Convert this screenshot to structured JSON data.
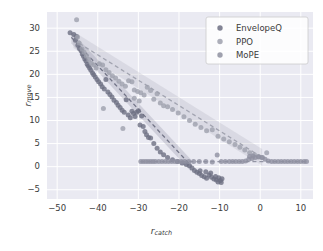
{
  "chart_data": {
    "type": "scatter",
    "title": "",
    "xlabel": "r_catch",
    "ylabel": "r_move",
    "xlabel_parts": {
      "base": "r",
      "sub": "catch"
    },
    "ylabel_parts": {
      "base": "r",
      "sub": "move"
    },
    "xlim": [
      -52.5,
      13.0
    ],
    "ylim": [
      -7.0,
      33.5
    ],
    "xticks": [
      -50,
      -40,
      -30,
      -20,
      -10,
      0,
      10
    ],
    "yticks": [
      -5,
      0,
      5,
      10,
      15,
      20,
      25,
      30
    ],
    "grid": true,
    "grid_color": "#ffffff",
    "plot_bg": "#eaeaf2",
    "figure_bg": "#ffffff",
    "legend": {
      "position": "upper right",
      "entries": [
        {
          "label": "EnvelopeQ",
          "color": "#6d6f82"
        },
        {
          "label": "PPO",
          "color": "#9ea0ad"
        },
        {
          "label": "MoPE",
          "color": "#8e90a0"
        }
      ]
    },
    "series": [
      {
        "name": "EnvelopeQ",
        "color": "#6d6f82",
        "marker": "o",
        "trend": {
          "type": "line",
          "style": "dashed",
          "x": [
            -46.5,
            -17.0
          ],
          "y": [
            28.0,
            0.2
          ],
          "band": 1.3
        },
        "points": [
          [
            -46.8,
            29.0
          ],
          [
            -45.9,
            28.6
          ],
          [
            -45.5,
            27.4
          ],
          [
            -45.2,
            28.2
          ],
          [
            -44.9,
            26.3
          ],
          [
            -44.5,
            25.6
          ],
          [
            -44.1,
            25.1
          ],
          [
            -43.8,
            24.4
          ],
          [
            -43.5,
            23.9
          ],
          [
            -43.2,
            23.3
          ],
          [
            -42.9,
            22.9
          ],
          [
            -42.6,
            22.2
          ],
          [
            -42.3,
            21.8
          ],
          [
            -42.0,
            21.4
          ],
          [
            -41.7,
            20.9
          ],
          [
            -41.3,
            20.3
          ],
          [
            -41.0,
            19.9
          ],
          [
            -40.6,
            19.4
          ],
          [
            -40.2,
            18.9
          ],
          [
            -39.8,
            18.4
          ],
          [
            -39.3,
            17.9
          ],
          [
            -38.9,
            17.3
          ],
          [
            -38.4,
            16.8
          ],
          [
            -38.0,
            18.9
          ],
          [
            -37.5,
            16.2
          ],
          [
            -37.0,
            15.6
          ],
          [
            -36.5,
            15.1
          ],
          [
            -36.0,
            14.4
          ],
          [
            -35.4,
            13.9
          ],
          [
            -35.0,
            13.3
          ],
          [
            -34.5,
            12.8
          ],
          [
            -34.0,
            12.2
          ],
          [
            -33.5,
            11.8
          ],
          [
            -33.0,
            14.5
          ],
          [
            -32.5,
            11.2
          ],
          [
            -32.0,
            10.6
          ],
          [
            -31.6,
            12.0
          ],
          [
            -31.2,
            11.5
          ],
          [
            -30.8,
            10.9
          ],
          [
            -30.4,
            11.8
          ],
          [
            -30.0,
            12.1
          ],
          [
            -29.6,
            9.0
          ],
          [
            -29.2,
            11.0
          ],
          [
            -28.8,
            8.7
          ],
          [
            -28.4,
            7.6
          ],
          [
            -28.0,
            6.9
          ],
          [
            -27.5,
            6.3
          ],
          [
            -27.0,
            6.2
          ],
          [
            -26.2,
            5.0
          ],
          [
            -25.4,
            4.0
          ],
          [
            -24.6,
            3.2
          ],
          [
            -23.8,
            2.6
          ],
          [
            -22.8,
            2.0
          ],
          [
            -21.6,
            1.5
          ],
          [
            -20.4,
            1.1
          ],
          [
            -19.2,
            0.8
          ],
          [
            -18.2,
            0.5
          ],
          [
            -17.4,
            0.2
          ],
          [
            -16.8,
            -0.3
          ],
          [
            -16.2,
            -0.8
          ],
          [
            -15.6,
            -1.2
          ],
          [
            -15.0,
            -1.5
          ],
          [
            -14.4,
            -1.9
          ],
          [
            -13.8,
            -2.2
          ],
          [
            -13.2,
            -2.5
          ],
          [
            -12.6,
            -1.8
          ],
          [
            -12.0,
            -2.3
          ],
          [
            -11.4,
            -2.7
          ],
          [
            -10.8,
            -2.9
          ],
          [
            -10.2,
            -2.4
          ],
          [
            -9.8,
            -3.0
          ],
          [
            -9.4,
            -2.6
          ],
          [
            -14.8,
            -0.9
          ],
          [
            -13.4,
            -1.1
          ],
          [
            -12.2,
            -1.4
          ],
          [
            -11.0,
            -2.1
          ],
          [
            -10.4,
            -3.3
          ],
          [
            -9.6,
            -3.4
          ]
        ]
      },
      {
        "name": "PPO",
        "color": "#9ea0ad",
        "marker": "o",
        "trend": {
          "type": "line",
          "style": "dashed",
          "x": [
            -46.0,
            0.5
          ],
          "y": [
            27.5,
            2.0
          ],
          "band": 1.8
        },
        "points": [
          [
            -45.2,
            31.8
          ],
          [
            -45.0,
            28.1
          ],
          [
            -44.6,
            26.8
          ],
          [
            -43.9,
            25.5
          ],
          [
            -43.4,
            24.8
          ],
          [
            -42.8,
            24.0
          ],
          [
            -42.2,
            23.2
          ],
          [
            -41.6,
            22.4
          ],
          [
            -41.0,
            22.0
          ],
          [
            -40.4,
            21.4
          ],
          [
            -39.6,
            22.3
          ],
          [
            -38.8,
            22.0
          ],
          [
            -38.0,
            21.0
          ],
          [
            -37.2,
            20.4
          ],
          [
            -36.4,
            19.7
          ],
          [
            -35.6,
            19.2
          ],
          [
            -34.8,
            18.5
          ],
          [
            -34.0,
            17.9
          ],
          [
            -33.2,
            17.4
          ],
          [
            -32.4,
            18.6
          ],
          [
            -31.6,
            18.4
          ],
          [
            -31.0,
            16.6
          ],
          [
            -30.2,
            16.3
          ],
          [
            -29.4,
            16.0
          ],
          [
            -28.6,
            15.5
          ],
          [
            -27.8,
            17.2
          ],
          [
            -27.0,
            16.5
          ],
          [
            -26.2,
            14.6
          ],
          [
            -25.4,
            15.8
          ],
          [
            -24.6,
            13.8
          ],
          [
            -23.8,
            13.2
          ],
          [
            -22.8,
            13.0
          ],
          [
            -21.6,
            12.4
          ],
          [
            -20.2,
            11.6
          ],
          [
            -18.8,
            10.8
          ],
          [
            -17.4,
            10.0
          ],
          [
            -16.0,
            9.2
          ],
          [
            -14.6,
            8.5
          ],
          [
            -13.2,
            7.8
          ],
          [
            -11.8,
            8.0
          ],
          [
            -10.4,
            6.6
          ],
          [
            -9.0,
            6.0
          ],
          [
            -7.6,
            5.4
          ],
          [
            -6.2,
            4.8
          ],
          [
            -5.0,
            4.2
          ],
          [
            -3.8,
            3.6
          ],
          [
            -2.6,
            3.0
          ],
          [
            -1.4,
            2.6
          ],
          [
            -0.4,
            2.2
          ],
          [
            0.6,
            2.0
          ],
          [
            1.6,
            3.0
          ],
          [
            -38.6,
            12.6
          ],
          [
            -33.8,
            8.3
          ],
          [
            -31.0,
            14.8
          ],
          [
            -29.8,
            14.2
          ]
        ]
      },
      {
        "name": "MoPE",
        "color": "#8e90a0",
        "marker": "o",
        "trend": {
          "type": "line",
          "style": "dashed",
          "x": [
            -29.5,
            11.5
          ],
          "y": [
            1.1,
            1.1
          ],
          "band": 0.0
        },
        "points": [
          [
            -29.4,
            1.1
          ],
          [
            -28.8,
            1.1
          ],
          [
            -28.2,
            1.1
          ],
          [
            -27.6,
            1.1
          ],
          [
            -27.0,
            1.1
          ],
          [
            -26.4,
            1.1
          ],
          [
            -25.8,
            1.1
          ],
          [
            -25.0,
            1.1
          ],
          [
            -24.2,
            1.1
          ],
          [
            -23.4,
            1.1
          ],
          [
            -22.6,
            1.1
          ],
          [
            -21.8,
            1.1
          ],
          [
            -21.0,
            1.1
          ],
          [
            -20.2,
            1.1
          ],
          [
            -19.4,
            1.1
          ],
          [
            -18.6,
            1.1
          ],
          [
            -17.6,
            1.1
          ],
          [
            -16.4,
            1.1
          ],
          [
            -15.0,
            1.1
          ],
          [
            -13.4,
            1.1
          ],
          [
            -11.8,
            1.0
          ],
          [
            -10.6,
            2.5
          ],
          [
            -9.6,
            1.1
          ],
          [
            -8.6,
            1.1
          ],
          [
            -7.6,
            1.1
          ],
          [
            -6.8,
            1.1
          ],
          [
            -6.0,
            1.1
          ],
          [
            -5.2,
            1.1
          ],
          [
            -4.4,
            1.1
          ],
          [
            -3.6,
            1.2
          ],
          [
            -2.8,
            1.6
          ],
          [
            -2.0,
            1.8
          ],
          [
            -1.2,
            2.0
          ],
          [
            -0.4,
            2.1
          ],
          [
            0.4,
            2.0
          ],
          [
            1.2,
            1.6
          ],
          [
            2.0,
            1.2
          ],
          [
            2.8,
            1.1
          ],
          [
            3.6,
            1.1
          ],
          [
            4.4,
            1.1
          ],
          [
            5.2,
            1.1
          ],
          [
            6.0,
            1.1
          ],
          [
            6.8,
            1.1
          ],
          [
            7.6,
            1.1
          ],
          [
            8.4,
            1.1
          ],
          [
            9.2,
            1.1
          ],
          [
            10.0,
            1.1
          ],
          [
            10.8,
            1.1
          ],
          [
            11.4,
            1.1
          ],
          [
            -1.8,
            2.3
          ],
          [
            -2.6,
            2.2
          ]
        ]
      }
    ]
  }
}
